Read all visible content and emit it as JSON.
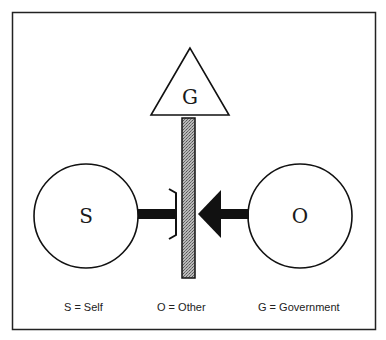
{
  "diagram": {
    "nodes": {
      "government": {
        "letter": "G",
        "shape": "triangle"
      },
      "self": {
        "letter": "S",
        "shape": "circle"
      },
      "other": {
        "letter": "O",
        "shape": "circle"
      }
    },
    "barrier": {
      "fill": "#9a9a9a"
    },
    "connections": [
      {
        "from": "self",
        "to": "barrier",
        "type": "bracket-block"
      },
      {
        "from": "other",
        "to": "barrier",
        "type": "arrow"
      }
    ],
    "legend": [
      {
        "text": "S = Self"
      },
      {
        "text": "O = Other"
      },
      {
        "text": "G = Government"
      }
    ],
    "colors": {
      "stroke": "#111111",
      "background": "#ffffff"
    }
  }
}
